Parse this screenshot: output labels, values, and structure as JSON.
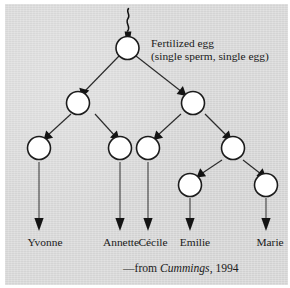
{
  "figure": {
    "root": {
      "line1": "Fertilized egg",
      "line2": "(single sperm, single egg)"
    },
    "names": [
      {
        "label": "Yvonne",
        "x": 40
      },
      {
        "label": "Annette",
        "x": 116
      },
      {
        "label": "Cécile",
        "x": 148
      },
      {
        "label": "Emilie",
        "x": 190
      },
      {
        "label": "Marie",
        "x": 265
      }
    ],
    "caption": {
      "dash_from": "—from ",
      "source": "Cummings",
      "year": ", 1994"
    },
    "colors": {
      "panel_background": "#d9d9d9",
      "page_background": "#ffffff",
      "node_fill": "#ffffff",
      "ink": "#1c1c1c"
    }
  }
}
